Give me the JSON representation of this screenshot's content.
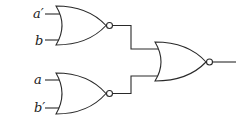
{
  "diagram": {
    "type": "logic-circuit",
    "inputs": [
      {
        "label": "a′",
        "gate": "nor-gate-1"
      },
      {
        "label": "b",
        "gate": "nor-gate-1"
      },
      {
        "label": "a",
        "gate": "nor-gate-2"
      },
      {
        "label": "b′",
        "gate": "nor-gate-2"
      }
    ],
    "gates": [
      {
        "id": "nor-gate-1",
        "type": "NOR",
        "inputs": [
          "a′",
          "b"
        ],
        "output_to": "nor-gate-3"
      },
      {
        "id": "nor-gate-2",
        "type": "NOR",
        "inputs": [
          "a",
          "b′"
        ],
        "output_to": "nor-gate-3"
      },
      {
        "id": "nor-gate-3",
        "type": "NOR",
        "inputs": [
          "nor-gate-1",
          "nor-gate-2"
        ],
        "output_to": "output"
      }
    ],
    "colors": {
      "stroke": "#2a2a2a",
      "background": "#ffffff",
      "label": "#222222"
    }
  }
}
